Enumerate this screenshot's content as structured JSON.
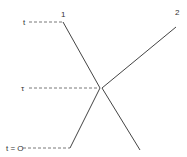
{
  "diagram": {
    "labels": {
      "t_top": "t",
      "tau": "τ",
      "t_zero": "t = O",
      "line1": "1",
      "line2": "2"
    },
    "colors": {
      "line": "#444444",
      "dashed": "#555555",
      "text": "#333333"
    }
  }
}
